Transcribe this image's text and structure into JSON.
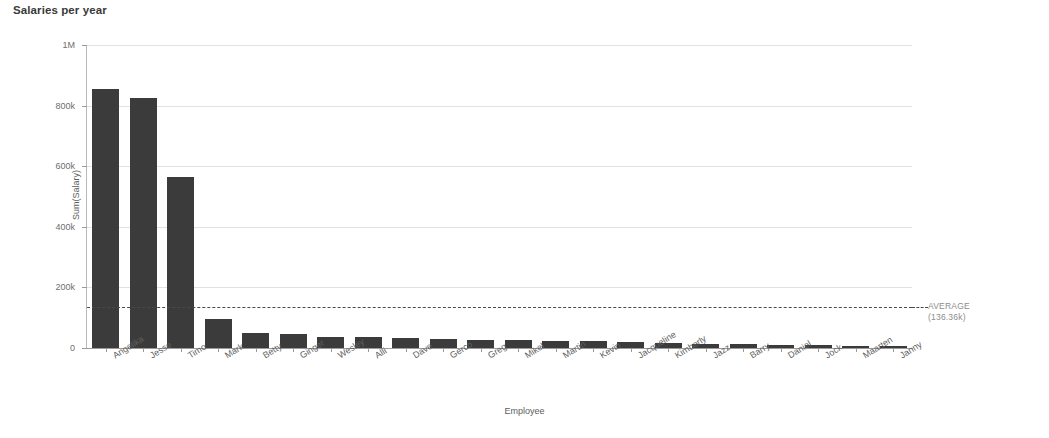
{
  "chart_data": {
    "type": "bar",
    "title": "Salaries per year",
    "xlabel": "Employee",
    "ylabel": "Sum(Salary)",
    "categories": [
      "Angelika",
      "Jesse",
      "Timo",
      "Mark",
      "Betty",
      "Ginger",
      "Wesley",
      "Alli",
      "Dave",
      "Gerco",
      "Greg",
      "Mikel",
      "Martin",
      "Kevin",
      "Jacqueline",
      "Kimberly",
      "Jazz",
      "Barry",
      "Daniel",
      "Jock",
      "Maarten",
      "Janny"
    ],
    "values": [
      855000,
      825000,
      565000,
      95000,
      48000,
      45000,
      38000,
      35000,
      33000,
      30000,
      28000,
      27000,
      24000,
      22000,
      20000,
      17000,
      14000,
      12000,
      11000,
      10000,
      8000,
      6000
    ],
    "ylim": [
      0,
      1000000
    ],
    "ytick_values": [
      0,
      200000,
      400000,
      600000,
      800000,
      1000000
    ],
    "ytick_labels": [
      "0",
      "200k",
      "400k",
      "600k",
      "800k",
      "1M"
    ],
    "grid": true,
    "legend": "none",
    "bar_color": "#3b3b3b",
    "gridline_color": "#e2e2e2",
    "axis_color": "#9a9a9a",
    "annotations": [
      {
        "name": "average-reference-line",
        "label_line1": "AVERAGE",
        "label_line2": "(136.36k)",
        "value": 136360,
        "style": "dashed",
        "color": "#4a4a4a"
      }
    ]
  },
  "top_sliver_text": "—"
}
